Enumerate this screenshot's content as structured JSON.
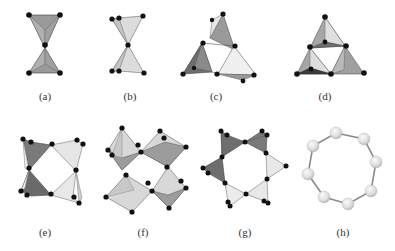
{
  "figure": {
    "panels": [
      {
        "id": "a",
        "label": "(a)",
        "label_pos": [
          45,
          97
        ],
        "description": "corner-sharing tetrahedral dimer"
      },
      {
        "id": "b",
        "label": "(b)",
        "label_pos": [
          130,
          97
        ],
        "description": "corner-sharing tetrahedral dimer (tilted view)"
      },
      {
        "id": "c",
        "label": "(c)",
        "label_pos": [
          216,
          97
        ],
        "description": "three-membered ring of tetrahedra (perspective)"
      },
      {
        "id": "d",
        "label": "(d)",
        "label_pos": [
          325,
          97
        ],
        "description": "three-membered ring of tetrahedra"
      },
      {
        "id": "e",
        "label": "(e)",
        "label_pos": [
          45,
          233
        ],
        "description": "four-membered ring of tetrahedra"
      },
      {
        "id": "f",
        "label": "(f)",
        "label_pos": [
          143,
          233
        ],
        "description": "four-membered ring of octahedra"
      },
      {
        "id": "g",
        "label": "(g)",
        "label_pos": [
          245,
          233
        ],
        "description": "six-membered ring of tetrahedra"
      },
      {
        "id": "h",
        "label": "(h)",
        "label_pos": [
          343,
          233
        ],
        "description": "eight-membered ring of atoms"
      }
    ]
  },
  "colors": {
    "dark_face": "#7a7a7a",
    "mid_face": "#a8a8a8",
    "light_face": "#d6d6d6",
    "lighter_face": "#ececec",
    "edge": "#555555",
    "atom": "#111111",
    "sphere": "#e4e4e4",
    "bond": "#8a8a8a",
    "label": "#333333"
  }
}
